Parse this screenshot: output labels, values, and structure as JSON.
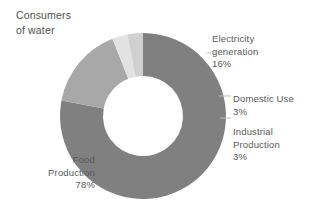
{
  "title": "Consumers\nof water",
  "chart_data": {
    "type": "pie",
    "variant": "donut",
    "title": "Consumers of water",
    "unit": "%",
    "categories": [
      "Food Production",
      "Electricity generation",
      "Domestic Use",
      "Industrial Production"
    ],
    "values": [
      78,
      16,
      3,
      3
    ],
    "colors": [
      "#808080",
      "#a8a8a8",
      "#e2e2e2",
      "#d0d0d0"
    ],
    "legend": "callout-labels",
    "grid": false,
    "start_angle_deg": 0,
    "direction": "clockwise",
    "slices": [
      {
        "name": "Food Production",
        "value": 78,
        "label": "Food\nProduction",
        "pct_label": "78%",
        "color": "#808080"
      },
      {
        "name": "Electricity generation",
        "value": 16,
        "label": "Electricity\ngeneration",
        "pct_label": "16%",
        "color": "#a8a8a8"
      },
      {
        "name": "Domestic Use",
        "value": 3,
        "label": "Domestic Use",
        "pct_label": "3%",
        "color": "#e2e2e2"
      },
      {
        "name": "Industrial Production",
        "value": 3,
        "label": "Industrial\nProduction",
        "pct_label": "3%",
        "color": "#d0d0d0"
      }
    ]
  },
  "labels": {
    "electricity": "Electricity\ngeneration",
    "electricity_pct": "16%",
    "domestic": "Domestic Use",
    "domestic_pct": "3%",
    "industrial": "Industrial\nProduction",
    "industrial_pct": "3%",
    "food": "Food\nProduction",
    "food_pct": "78%"
  },
  "style": {
    "text_color": "#595959",
    "background": "#ffffff",
    "leader_color": "#bdbdbd"
  }
}
